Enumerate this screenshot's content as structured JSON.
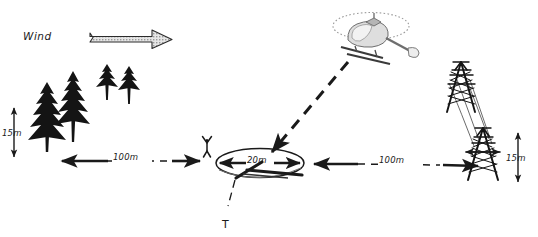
{
  "diagram": {
    "background_color": "#ffffff",
    "ink_color": "#1a1a1a",
    "sketch_color": "#8a8a8a"
  },
  "wind": {
    "label": "Wind",
    "arrow_direction": "right",
    "arrow_fill": "#d0d0d0",
    "arrow_stroke": "#2b2b2b"
  },
  "obstacles": {
    "trees": {
      "name": "conifer-trees",
      "count": 4,
      "height_label": "15m",
      "side": "left"
    },
    "pylons": {
      "name": "power-transmission-pylons",
      "count": 2,
      "height_label": "15m",
      "side": "right"
    }
  },
  "dimensions": [
    {
      "id": "left-clearance",
      "label": "100m",
      "orientation": "horizontal",
      "side": "left"
    },
    {
      "id": "right-clearance",
      "label": "100m",
      "orientation": "horizontal",
      "side": "right"
    },
    {
      "id": "tree-height",
      "label": "15m",
      "orientation": "vertical",
      "side": "left"
    },
    {
      "id": "pylon-height",
      "label": "15m",
      "orientation": "vertical",
      "side": "right"
    },
    {
      "id": "landing-zone-diameter",
      "label": "20m",
      "orientation": "horizontal",
      "side": "center"
    }
  ],
  "landing_zone": {
    "name": "landing-zone-ellipse",
    "diameter_label": "20m",
    "marker_label": "T",
    "marker_description": "T-marker ground panel"
  },
  "marshaller": {
    "name": "marshaller-figure",
    "description": "ground marshaller with raised arms"
  },
  "aircraft": {
    "name": "helicopter",
    "approach_path": "dashed descending line to landing zone",
    "rotor_disc": "dotted ellipse"
  }
}
